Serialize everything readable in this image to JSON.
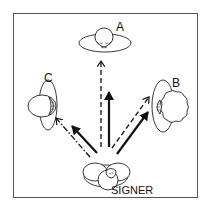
{
  "diagram": {
    "type": "signing-space-addressees",
    "labels": {
      "a": "A",
      "b": "B",
      "c": "C",
      "signer": "SIGNER"
    },
    "nodes": [
      {
        "id": "A",
        "role": "addressee",
        "position": "top-center"
      },
      {
        "id": "B",
        "role": "addressee",
        "position": "right"
      },
      {
        "id": "C",
        "role": "addressee",
        "position": "left"
      },
      {
        "id": "SIGNER",
        "role": "signer",
        "position": "bottom-center"
      }
    ],
    "edges": [
      {
        "from": "SIGNER",
        "to": "A",
        "style": "dashed"
      },
      {
        "from": "SIGNER",
        "to": "A",
        "style": "solid-bold"
      },
      {
        "from": "SIGNER",
        "to": "B",
        "style": "dashed"
      },
      {
        "from": "SIGNER",
        "to": "B",
        "style": "solid-bold"
      },
      {
        "from": "SIGNER",
        "to": "C",
        "style": "dash-dot"
      },
      {
        "from": "SIGNER",
        "to": "C",
        "style": "solid-bold"
      }
    ],
    "colors": {
      "stroke": "#111111",
      "frame": "#555555",
      "background": "#ffffff"
    }
  }
}
